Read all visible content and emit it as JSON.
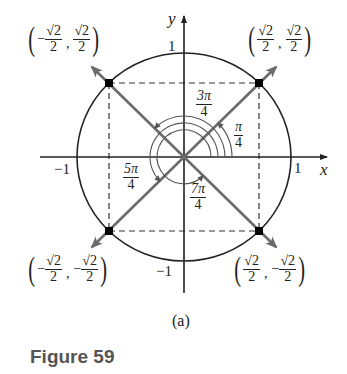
{
  "figure": {
    "caption": "Figure 59",
    "sublabel": "(a)",
    "axes": {
      "x_label": "x",
      "y_label": "y",
      "tick_pos_x": "1",
      "tick_neg_x": "−1",
      "tick_pos_y": "1",
      "tick_neg_y": "−1"
    },
    "angles": [
      {
        "num": "π",
        "den": "4"
      },
      {
        "num": "3π",
        "den": "4"
      },
      {
        "num": "5π",
        "den": "4"
      },
      {
        "num": "7π",
        "den": "4"
      }
    ],
    "points": [
      {
        "name": "Q1",
        "x_sign": "",
        "x_num": "√2",
        "x_den": "2",
        "y_sign": "",
        "y_num": "√2",
        "y_den": "2"
      },
      {
        "name": "Q2",
        "x_sign": "−",
        "x_num": "√2",
        "x_den": "2",
        "y_sign": "",
        "y_num": "√2",
        "y_den": "2"
      },
      {
        "name": "Q3",
        "x_sign": "−",
        "x_num": "√2",
        "x_den": "2",
        "y_sign": "−",
        "y_num": "√2",
        "y_den": "2"
      },
      {
        "name": "Q4",
        "x_sign": "",
        "x_num": "√2",
        "x_den": "2",
        "y_sign": "−",
        "y_num": "√2",
        "y_den": "2"
      }
    ],
    "colors": {
      "ray": "#6b6b6b",
      "circle": "#222222",
      "axis": "#222222"
    }
  }
}
